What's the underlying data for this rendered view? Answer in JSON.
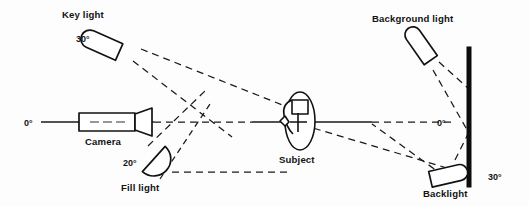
{
  "figure": {
    "background_color": "#fdfdfd",
    "line_color": "#181818"
  },
  "labels": {
    "key_light": "Key light",
    "key_light_angle": "30°",
    "camera": "Camera",
    "camera_angle": "0°",
    "fill_light": "Fill light",
    "fill_light_angle": "20°",
    "subject": "Subject",
    "background_light": "Background light",
    "backlight": "Backlight",
    "backlight_angle": "30°",
    "background_axis_angle": "0°"
  },
  "elements": [
    {
      "name": "key-light",
      "label": "Key light",
      "angle": "30°",
      "shape": "capsule-fixture",
      "position": "upper-left"
    },
    {
      "name": "camera",
      "label": "Camera",
      "angle": "0°",
      "shape": "camera-body-with-lens",
      "position": "center-left"
    },
    {
      "name": "fill-light",
      "label": "Fill light",
      "angle": "20°",
      "shape": "half-moon-fixture",
      "position": "lower-left"
    },
    {
      "name": "subject",
      "label": "Subject",
      "angle": "",
      "shape": "head-plan-view-with-crosshair",
      "position": "center"
    },
    {
      "name": "background-light",
      "label": "Background light",
      "angle": "",
      "shape": "capsule-fixture",
      "position": "upper-right"
    },
    {
      "name": "backlight",
      "label": "Backlight",
      "angle": "30°",
      "shape": "capsule-fixture",
      "position": "lower-right"
    },
    {
      "name": "background-wall",
      "label": "",
      "angle": "",
      "shape": "thick-vertical-bar",
      "position": "far-right"
    }
  ]
}
